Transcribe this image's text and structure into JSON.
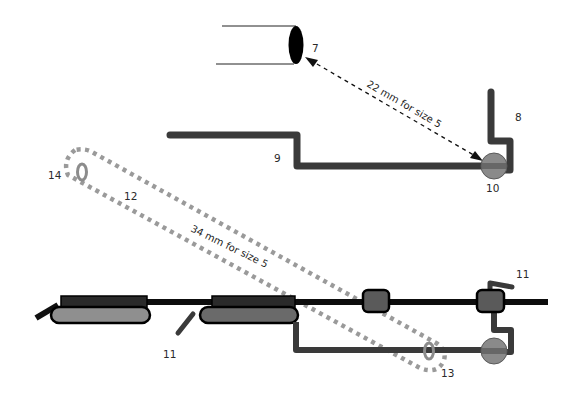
{
  "diagram": {
    "colors": {
      "wire": "#3a3a3a",
      "archwire": "#0d0d0d",
      "bracket_fill": "#555555",
      "pad_fill": "#8f8f8f",
      "tube_circle": "#8a8a8a",
      "dotted_gray": "#9a9a9a",
      "ring": "#8c8c8c",
      "cylinder_end": "#000000",
      "background": "#ffffff"
    },
    "labels": {
      "l7": "7",
      "l8": "8",
      "l9": "9",
      "l10": "10",
      "l11_bottom": "11",
      "l11_right": "11",
      "l12": "12",
      "l13": "13",
      "l14": "14"
    },
    "annotations": {
      "upper_measure": "22 mm for size 5",
      "lower_measure": "34 mm for size 5"
    }
  }
}
